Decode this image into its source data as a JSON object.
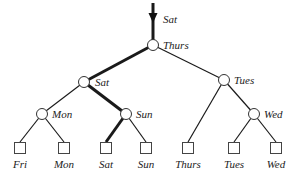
{
  "diagram": {
    "type": "tree",
    "root_input": {
      "label": "Sat"
    },
    "internal_nodes": [
      {
        "id": "n0",
        "label": "Thurs",
        "x": 153,
        "y": 45
      },
      {
        "id": "n1",
        "label": "Sat",
        "x": 84,
        "y": 82
      },
      {
        "id": "n2",
        "label": "Tues",
        "x": 224,
        "y": 80
      },
      {
        "id": "n3",
        "label": "Mon",
        "x": 42,
        "y": 114
      },
      {
        "id": "n4",
        "label": "Sun",
        "x": 126,
        "y": 114
      },
      {
        "id": "n5",
        "label": "Wed",
        "x": 254,
        "y": 114
      }
    ],
    "leaves": [
      {
        "id": "l0",
        "label": "Fri",
        "x": 20
      },
      {
        "id": "l1",
        "label": "Mon",
        "x": 64
      },
      {
        "id": "l2",
        "label": "Sat",
        "x": 106
      },
      {
        "id": "l3",
        "label": "Sun",
        "x": 146
      },
      {
        "id": "l4",
        "label": "Thurs",
        "x": 188
      },
      {
        "id": "l5",
        "label": "Tues",
        "x": 234
      },
      {
        "id": "l6",
        "label": "Wed",
        "x": 276
      }
    ],
    "highlighted_path": [
      "Thurs",
      "Sat",
      "Sun",
      "Sat"
    ]
  }
}
